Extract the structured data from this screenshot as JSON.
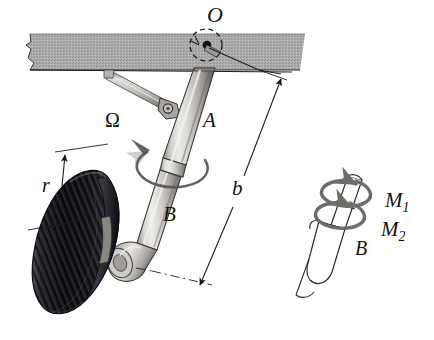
{
  "figure": {
    "kind": "engineering-illustration",
    "background_color": "#ffffff"
  },
  "labels": {
    "pivot_O": "O",
    "strut_upper_A": "A",
    "strut_lower_B": "B",
    "angular_velocity": "Ω",
    "wheel_radius": "r",
    "strut_length": "b",
    "inset_strut_B": "B",
    "moment_1": "M",
    "moment_1_sub": "1",
    "moment_2": "M",
    "moment_2_sub": "2"
  },
  "parts": {
    "ceiling_plate": "ceiling-mounting-plate",
    "pivot_joint": "pivot-point-O",
    "drag_brace": "drag-brace-link",
    "clevis_joint": "clevis-pin-joint",
    "upper_strut": "upper-strut-A",
    "lower_strut": "lower-strut-B",
    "axle_fork": "axle-fork",
    "wheel": "wheel-tire",
    "rotation_arrow": "omega-rotation-arrow",
    "dimension_b": "dimension-line-b",
    "dimension_r": "dimension-line-r",
    "centerline": "axle-centerline",
    "inset": "inset-torque-diagram",
    "torque_helix": "torque-helix-arrows"
  },
  "colors": {
    "ceiling_gray": "#a9a9a9",
    "ceiling_edge": "#3a3a3a",
    "metal_light": "#e3e1de",
    "metal_mid": "#b8b5b0",
    "metal_dark": "#7d7a75",
    "metal_shadow": "#56534f",
    "tire_dark": "#15151a",
    "tire_mid": "#2b2b31",
    "tire_highlight": "#5e5e66",
    "line_black": "#15130f",
    "torque_gray": "#6e6c69",
    "inset_line": "#2a2a2a"
  }
}
